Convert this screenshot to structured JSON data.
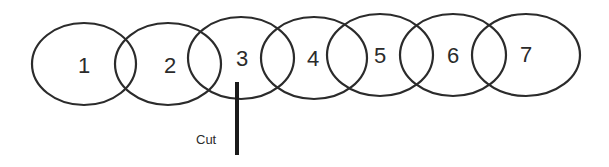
{
  "diagram": {
    "rings": [
      {
        "label": "1",
        "cx": 84,
        "cy": 64,
        "rx": 52,
        "ry": 41
      },
      {
        "label": "2",
        "cx": 168,
        "cy": 64,
        "rx": 53,
        "ry": 41
      },
      {
        "label": "3",
        "cx": 241,
        "cy": 58,
        "rx": 53,
        "ry": 41
      },
      {
        "label": "4",
        "cx": 314,
        "cy": 58,
        "rx": 53,
        "ry": 41
      },
      {
        "label": "5",
        "cx": 380,
        "cy": 55,
        "rx": 53,
        "ry": 41
      },
      {
        "label": "6",
        "cx": 453,
        "cy": 55,
        "rx": 53,
        "ry": 41
      },
      {
        "label": "7",
        "cx": 526,
        "cy": 55,
        "rx": 54,
        "ry": 41
      }
    ],
    "cut": {
      "label": "Cut",
      "x": 237,
      "y1": 82,
      "y2": 155
    },
    "colors": {
      "stroke": "#2b2b2b",
      "background": "#ffffff"
    }
  }
}
